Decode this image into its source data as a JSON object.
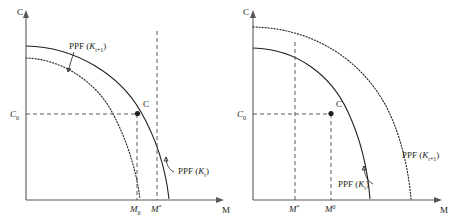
{
  "figure": {
    "type": "diagram",
    "panels": [
      {
        "id": "left",
        "axes": {
          "y_label": "C",
          "x_label": "M",
          "y_ticks": [
            {
              "label_main": "C",
              "label_sub": "0",
              "value_frac": 0.52
            }
          ],
          "x_ticks": [
            {
              "label_main": "M",
              "label_sub": "0",
              "label_sup": "",
              "value_frac": 0.6
            },
            {
              "label_main": "M",
              "label_sub": "",
              "label_sup": "*",
              "value_frac": 0.725
            }
          ]
        },
        "curves": [
          {
            "name": "PPF_Kt",
            "style": "solid",
            "label_main": "PPF (",
            "label_k": "K",
            "label_sub": "t",
            "label_close": ")"
          },
          {
            "name": "PPF_Kt1",
            "style": "dotted",
            "label_main": "PPF (",
            "label_k": "K",
            "label_sub": "t+1",
            "label_close": ")"
          }
        ],
        "points": [
          {
            "name": "C-point",
            "label": "C"
          }
        ]
      },
      {
        "id": "right",
        "axes": {
          "y_label": "C",
          "x_label": "M",
          "y_ticks": [
            {
              "label_main": "C",
              "label_sub": "0",
              "value_frac": 0.52
            }
          ],
          "x_ticks": [
            {
              "label_main": "M",
              "label_sub": "",
              "label_sup": "*",
              "value_frac": 0.475
            },
            {
              "label_main": "M",
              "label_sub": "",
              "label_sup": "0",
              "value_frac": 0.625
            }
          ]
        },
        "curves": [
          {
            "name": "PPF_Kt",
            "style": "solid",
            "label_main": "PPF (",
            "label_k": "K",
            "label_sub": "t",
            "label_close": ")"
          },
          {
            "name": "PPF_Kt1",
            "style": "dotted",
            "label_main": "PPF (",
            "label_k": "K",
            "label_sub": "t+1",
            "label_close": ")"
          }
        ],
        "points": [
          {
            "name": "C-point",
            "label": "C"
          }
        ]
      }
    ],
    "colors": {
      "curve": "#231f20",
      "axis": "#58585b",
      "guide": "#58585b",
      "background": "#ffffff"
    }
  }
}
